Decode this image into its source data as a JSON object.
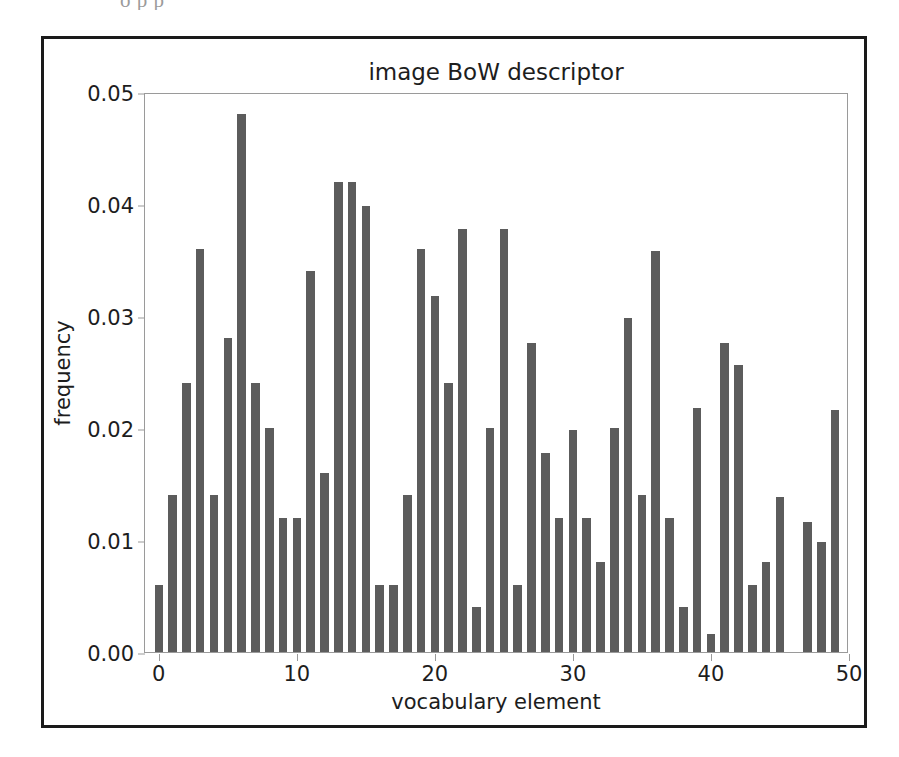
{
  "page": {
    "scan_artifact_text": "o       p          p"
  },
  "figure": {
    "title": "image BoW descriptor",
    "xlabel": "vocabulary element",
    "ylabel": "frequency",
    "bar_color": "#5c5c5c",
    "axes_border_color": "#9a9a9a",
    "frame_color": "#1a1a1a",
    "text_color": "#1d1d1d"
  },
  "chart_data": {
    "type": "bar",
    "title": "image BoW descriptor",
    "xlabel": "vocabulary element",
    "ylabel": "frequency",
    "xlim": [
      -1,
      50
    ],
    "ylim": [
      0.0,
      0.05
    ],
    "grid": false,
    "legend": null,
    "xticks": [
      0,
      10,
      20,
      30,
      40,
      50
    ],
    "xtick_labels": [
      "0",
      "10",
      "20",
      "30",
      "40",
      "50"
    ],
    "yticks": [
      0.0,
      0.01,
      0.02,
      0.03,
      0.04,
      0.05
    ],
    "ytick_labels": [
      "0.00",
      "0.01",
      "0.02",
      "0.03",
      "0.04",
      "0.05"
    ],
    "categories": [
      0,
      1,
      2,
      3,
      4,
      5,
      6,
      7,
      8,
      9,
      10,
      11,
      12,
      13,
      14,
      15,
      16,
      17,
      18,
      19,
      20,
      21,
      22,
      23,
      24,
      25,
      26,
      27,
      28,
      29,
      30,
      31,
      32,
      33,
      34,
      35,
      36,
      37,
      38,
      39,
      40,
      41,
      42,
      43,
      44,
      45,
      46,
      47,
      48,
      49
    ],
    "values": [
      0.006,
      0.014,
      0.024,
      0.036,
      0.014,
      0.028,
      0.048,
      0.024,
      0.02,
      0.012,
      0.012,
      0.034,
      0.016,
      0.042,
      0.042,
      0.0398,
      0.006,
      0.006,
      0.014,
      0.036,
      0.0318,
      0.024,
      0.0378,
      0.004,
      0.02,
      0.0378,
      0.006,
      0.0276,
      0.0178,
      0.012,
      0.0198,
      0.012,
      0.008,
      0.02,
      0.0298,
      0.014,
      0.0358,
      0.012,
      0.004,
      0.0218,
      0.0016,
      0.0276,
      0.0256,
      0.006,
      0.008,
      0.0138,
      0.0,
      0.0116,
      0.0098,
      0.0216
    ]
  }
}
